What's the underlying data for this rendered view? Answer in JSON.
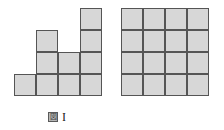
{
  "figures": [
    {
      "id": "figure-one",
      "caption_cjk": "図",
      "caption_numeral": "I",
      "caption_full": "図 I",
      "grid": {
        "columns": 4,
        "rows": 4,
        "cell_size_px": 22,
        "column_heights": [
          1,
          3,
          2,
          4
        ],
        "total_cells": 10,
        "alignment": "bottom",
        "cells": [
          {
            "col": 0,
            "row": 3
          },
          {
            "col": 1,
            "row": 1
          },
          {
            "col": 1,
            "row": 2
          },
          {
            "col": 1,
            "row": 3
          },
          {
            "col": 2,
            "row": 2
          },
          {
            "col": 2,
            "row": 3
          },
          {
            "col": 3,
            "row": 0
          },
          {
            "col": 3,
            "row": 1
          },
          {
            "col": 3,
            "row": 2
          },
          {
            "col": 3,
            "row": 3
          }
        ]
      }
    },
    {
      "id": "figure-two",
      "caption_cjk": "図",
      "caption_numeral": "II",
      "caption_full": "図 II",
      "grid": {
        "columns": 4,
        "rows": 4,
        "cell_size_px": 22,
        "column_heights": [
          4,
          4,
          4,
          4
        ],
        "total_cells": 16,
        "alignment": "bottom",
        "cells": [
          {
            "col": 0,
            "row": 0
          },
          {
            "col": 1,
            "row": 0
          },
          {
            "col": 2,
            "row": 0
          },
          {
            "col": 3,
            "row": 0
          },
          {
            "col": 0,
            "row": 1
          },
          {
            "col": 1,
            "row": 1
          },
          {
            "col": 2,
            "row": 1
          },
          {
            "col": 3,
            "row": 1
          },
          {
            "col": 0,
            "row": 2
          },
          {
            "col": 1,
            "row": 2
          },
          {
            "col": 2,
            "row": 2
          },
          {
            "col": 3,
            "row": 2
          },
          {
            "col": 0,
            "row": 3
          },
          {
            "col": 1,
            "row": 3
          },
          {
            "col": 2,
            "row": 3
          },
          {
            "col": 3,
            "row": 3
          }
        ]
      }
    }
  ],
  "colors": {
    "cell_fill": "#d7d7d7",
    "cell_border": "#555555",
    "background": "#ffffff",
    "caption_text": "#1a1a1a",
    "caption_cjk_fill": "#b8b8b8"
  }
}
